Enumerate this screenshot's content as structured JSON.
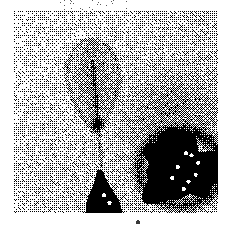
{
  "document": {
    "kind": "scanned-halftone-photograph",
    "title": "Leaf specimen halftone scan",
    "page_background": "#ffffff",
    "ink_color": "#000000"
  },
  "plate": {
    "name": "halftone-image-plate",
    "x": 14,
    "y": 11,
    "width": 204,
    "height": 202,
    "paper": "#ffffff",
    "border": "none",
    "rendering": "1-bit dithered noise / error-diffusion halftone",
    "grain": {
      "cell": 1,
      "density_light": 0.17,
      "density_mid": 0.46,
      "density_dark": 0.78,
      "seed": 20240517
    },
    "tone_regions": [
      {
        "name": "background-upper-left-light",
        "shape": "rect",
        "tone": 0.14,
        "note": "lightest field, sparse speckle"
      },
      {
        "name": "background-right-midtone-cloud",
        "shape": "ellipse",
        "cx": 0.78,
        "cy": 0.52,
        "rx": 0.36,
        "ry": 0.34,
        "tone": 0.42,
        "note": "broad darker grey cloud behind right blob"
      },
      {
        "name": "leaf-blade",
        "shape": "teardrop",
        "cx": 0.38,
        "cy": 0.37,
        "rx": 0.13,
        "ry": 0.24,
        "tone": 0.5,
        "note": "central leaf / teardrop, apex up, rounded base"
      },
      {
        "name": "leaf-midrib-and-stem",
        "shape": "line",
        "x1": 0.385,
        "y1": 0.24,
        "x2": 0.43,
        "y2": 0.78,
        "tone": 0.62,
        "note": "faint vertical stem descending from leaf base"
      },
      {
        "name": "leaf-base-dark-cluster",
        "shape": "blob",
        "cx": 0.41,
        "cy": 0.56,
        "rx": 0.055,
        "ry": 0.05,
        "tone": 0.82,
        "note": "dense ink cluster at base of the leaf"
      },
      {
        "name": "solid-black-blob-right",
        "shape": "solid",
        "cx": 0.82,
        "cy": 0.78,
        "rx": 0.2,
        "ry": 0.17,
        "tone": 1.0,
        "note": "large saturated black mass lower right with white pinholes"
      },
      {
        "name": "solid-black-spike-bottom-center",
        "shape": "solid",
        "cx": 0.44,
        "cy": 0.92,
        "rx": 0.1,
        "ry": 0.13,
        "tone": 1.0,
        "note": "black triangular spike rising from bottom edge"
      }
    ],
    "white_pinholes": [
      {
        "x": 0.845,
        "y": 0.705
      },
      {
        "x": 0.872,
        "y": 0.716
      },
      {
        "x": 0.804,
        "y": 0.773
      },
      {
        "x": 0.905,
        "y": 0.752
      },
      {
        "x": 0.857,
        "y": 0.846
      },
      {
        "x": 0.833,
        "y": 0.884
      },
      {
        "x": 0.892,
        "y": 0.812
      },
      {
        "x": 0.778,
        "y": 0.828
      },
      {
        "x": 0.44,
        "y": 0.915
      },
      {
        "x": 0.468,
        "y": 0.952
      }
    ]
  },
  "page_marks": {
    "top_dust": {
      "name": "top-margin-dust-specks",
      "x": 60,
      "y": 0,
      "width": 70,
      "height": 10,
      "density": 0.035,
      "note": "faint scattered scanner dust above the plate"
    },
    "bottom_speck": {
      "name": "bottom-margin-speck",
      "x": 136,
      "y": 220,
      "width": 4,
      "height": 6,
      "color": "#3a3a3a",
      "note": "small isolated dark mark below the plate"
    }
  },
  "text": {
    "visible_text": "",
    "note": "no legible text anywhere in the screenshot"
  }
}
